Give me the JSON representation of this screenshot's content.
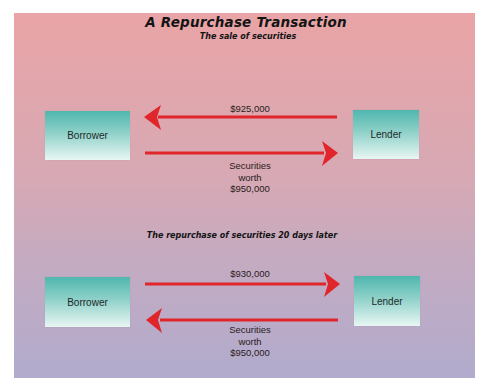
{
  "title": "A Repurchase Transaction",
  "subtitle": "The sale of securities",
  "colors": {
    "background_top": "#e9a4a6",
    "background_bottom": "#b1abcd",
    "box_top": "#4fb7ae",
    "box_bottom": "#e8f6f3",
    "arrow": "#e0262a"
  },
  "sale": {
    "borrower_label": "Borrower",
    "lender_label": "Lender",
    "cash_flow": {
      "direction": "lender-to-borrower",
      "amount": "$925,000"
    },
    "securities_flow": {
      "direction": "borrower-to-lender",
      "line1": "Securities",
      "line2": "worth",
      "line3": "$950,000"
    }
  },
  "repurchase": {
    "section_title": "The repurchase of securities 20 days later",
    "borrower_label": "Borrower",
    "lender_label": "Lender",
    "cash_flow": {
      "direction": "borrower-to-lender",
      "amount": "$930,000"
    },
    "securities_flow": {
      "direction": "lender-to-borrower",
      "line1": "Securities",
      "line2": "worth",
      "line3": "$950,000"
    }
  }
}
